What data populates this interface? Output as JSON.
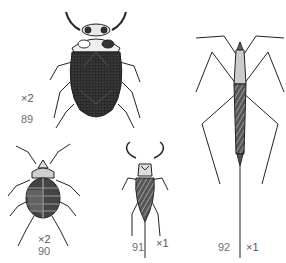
{
  "plate": {
    "figures": [
      {
        "number": "89",
        "magnification": "×2",
        "description": "dark oval water beetle-like bug, dorsal view"
      },
      {
        "number": "90",
        "magnification": "×2",
        "description": "rounded segmented bug, dorsal view"
      },
      {
        "number": "91",
        "magnification": "×1",
        "description": "water scorpion with raptorial forelegs and breathing tube"
      },
      {
        "number": "92",
        "magnification": "×1",
        "description": "slender stick-like water scorpion with long legs and breathing tube"
      }
    ]
  },
  "colors": {
    "background": "#ffffff",
    "ink": "#1a1a1a",
    "label": "#6e6e6e"
  }
}
